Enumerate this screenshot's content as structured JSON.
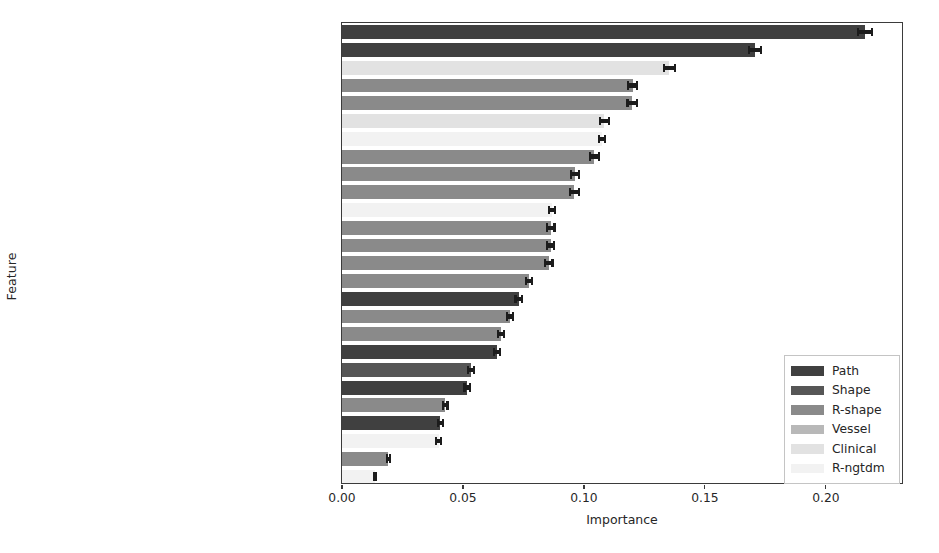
{
  "chart_data": {
    "type": "bar",
    "orientation": "horizontal",
    "title": "",
    "xlabel": "Importance",
    "ylabel": "Feature",
    "xlim": [
      0.0,
      0.2323
    ],
    "xticks": [
      0.0,
      0.05,
      0.1,
      0.15,
      0.2
    ],
    "xticklabels": [
      "0.00",
      "0.05",
      "0.10",
      "0.15",
      "0.20"
    ],
    "grid": false,
    "legend_position": "center right",
    "categories": [
      "Bifurcation-2 (Path)",
      "Bifurcation-1 (Path)",
      "Sex (Clinical)",
      "Elongation (R-shape)",
      "Flatness (R-shape)",
      "Age (Clinical)",
      "Complexity (R-ngtdm)",
      "SurfaceVolumeRatio (R-shape)",
      "MajorAxisLength (R-shape)",
      "Maximum3DDiameter (R-shape)",
      "Coarseness (R-ngtdm)",
      "Maximum2DDiameterRow (R-shape)",
      "Maximum2DDiameterColumn (R-shape)",
      "Sphericity (R-shape)",
      "Maximum2DDiameterSlice (R-shape)",
      "NrBifurcations (Path)",
      "LeastAxisLength (R-shape)",
      "MinorAxisLength (R-shape)",
      "VesselLength (Path)",
      "ConvexityStd (Shape)",
      "Bifurcation-0 (Path)",
      "SurfaceArea (R-shape)",
      "VesselVolume (Path)",
      "Contrast (R-ngtdm)",
      "MeshVolume (R-shape)",
      "Busyness (R-ngtdm)"
    ],
    "values": [
      0.2162,
      0.1707,
      0.1353,
      0.1202,
      0.1199,
      0.1085,
      0.1074,
      0.1043,
      0.0963,
      0.0961,
      0.0868,
      0.0863,
      0.0862,
      0.0855,
      0.0773,
      0.073,
      0.0694,
      0.0657,
      0.064,
      0.0533,
      0.0517,
      0.0426,
      0.0407,
      0.0399,
      0.0192,
      0.0137
    ],
    "errors": [
      0.003,
      0.0026,
      0.0022,
      0.0019,
      0.0019,
      0.0018,
      0.0013,
      0.0018,
      0.0017,
      0.0017,
      0.0014,
      0.0015,
      0.0015,
      0.0015,
      0.0014,
      0.0013,
      0.0013,
      0.0013,
      0.0013,
      0.0011,
      0.0011,
      0.001,
      0.001,
      0.0009,
      0.0007,
      0.0005
    ],
    "groups": [
      "Path",
      "Path",
      "Clinical",
      "R-shape",
      "R-shape",
      "Clinical",
      "R-ngtdm",
      "R-shape",
      "R-shape",
      "R-shape",
      "R-ngtdm",
      "R-shape",
      "R-shape",
      "R-shape",
      "R-shape",
      "Path",
      "R-shape",
      "R-shape",
      "Path",
      "Shape",
      "Path",
      "R-shape",
      "Path",
      "R-ngtdm",
      "R-shape",
      "R-ngtdm"
    ],
    "legend": [
      {
        "label": "Path",
        "color": "#404040"
      },
      {
        "label": "Shape",
        "color": "#565656"
      },
      {
        "label": "R-shape",
        "color": "#8a8a8a"
      },
      {
        "label": "Vessel",
        "color": "#b8b8b8"
      },
      {
        "label": "Clinical",
        "color": "#e2e2e2"
      },
      {
        "label": "R-ngtdm",
        "color": "#f2f2f2"
      }
    ],
    "group_colors": {
      "Path": "#404040",
      "Shape": "#565656",
      "R-shape": "#8a8a8a",
      "Vessel": "#b8b8b8",
      "Clinical": "#e2e2e2",
      "R-ngtdm": "#f2f2f2"
    },
    "axis_color": "#3b3b3b",
    "error_color": "#1c1c1c"
  }
}
